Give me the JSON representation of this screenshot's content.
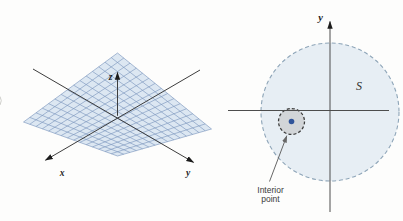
{
  "background": "#fdfdfc",
  "left_figure": {
    "x_label": "x",
    "y_label": "y",
    "z_label": "z",
    "surface_fill": "#dce7f2",
    "surface_grid_color": "#7d97be",
    "axis_color": "#3d3d3d"
  },
  "right_figure": {
    "y_axis_label": "y",
    "set_label": "S",
    "interior_label_line1": "Interior",
    "interior_label_line2": "point",
    "disk_fill": "#e7eef4",
    "disk_border_color": "#8ea5b8",
    "neighborhood_fill": "#d2d5d8",
    "neighborhood_border_color": "#3a3a3a",
    "interior_point_color": "#30549a",
    "axis_color": "#4d4d4d",
    "annotation_arrow_color": "#676767"
  }
}
